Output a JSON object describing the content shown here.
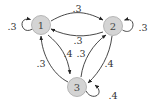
{
  "diagram": {
    "type": "markov-chain-state-diagram",
    "colors": {
      "node_fill": "#d4d4d4",
      "node_stroke": "#a8a8a8",
      "edge": "#333333",
      "text": "#333333"
    },
    "nodes": [
      {
        "id": "1",
        "label": "1"
      },
      {
        "id": "2",
        "label": "2"
      },
      {
        "id": "3",
        "label": "3"
      }
    ],
    "edges": [
      {
        "from": "1",
        "to": "1",
        "label": ".3"
      },
      {
        "from": "1",
        "to": "2",
        "label": ".3"
      },
      {
        "from": "2",
        "to": "1",
        "label": ".3"
      },
      {
        "from": "2",
        "to": "2",
        "label": ".3"
      },
      {
        "from": "3",
        "to": "1",
        "label": ".3"
      },
      {
        "from": "1",
        "to": "3",
        "label": ".4"
      },
      {
        "from": "3",
        "to": "2",
        "label": ".3"
      },
      {
        "from": "2",
        "to": "3",
        "label": ".4"
      },
      {
        "from": "3",
        "to": "3",
        "label": ".4"
      }
    ]
  }
}
